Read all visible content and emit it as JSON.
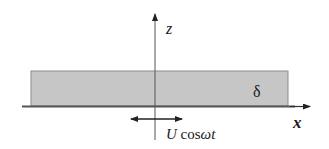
{
  "diagram": {
    "type": "oscillating-plate-boundary-layer",
    "layer": {
      "label": "δ",
      "fill": "#c8c8c8",
      "stroke": "#8a8a8a"
    },
    "axes": {
      "horizontal_label": "x",
      "vertical_label": "z",
      "color": "#333333"
    },
    "plate_motion": {
      "symbol": "U",
      "function": "cos",
      "argument": "ωt",
      "arrow": "double-headed"
    }
  }
}
